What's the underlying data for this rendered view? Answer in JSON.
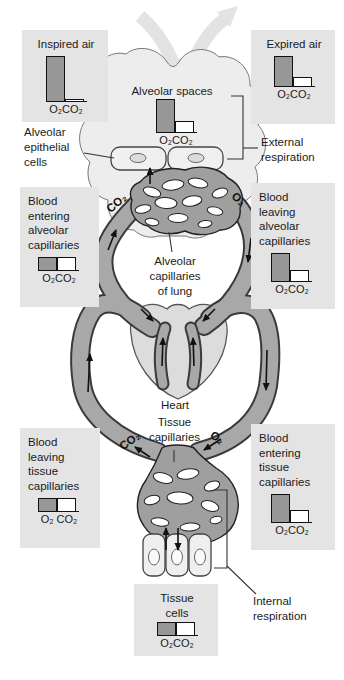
{
  "figure_caption": "Gas exchange diagram: external and internal respiration",
  "colors": {
    "background": "#ffffff",
    "panel_background": "#e4e4e4",
    "bar_o2_fill": "#979797",
    "bar_co2_fill": "#ffffff",
    "vessel_fill": "#a8a8a8",
    "vessel_outline": "#3a3a3a",
    "lung_fill": "#ededed",
    "heart_fill": "#dcdcdc",
    "air_arrow_fill": "#e3e3e3",
    "text": "#1b1b1b"
  },
  "panels": {
    "inspired_air": {
      "label": "Inspired air",
      "o2": 1.0,
      "co2": 0.04,
      "gas": "O₂CO₂"
    },
    "expired_air": {
      "label": "Expired air",
      "o2": 0.67,
      "co2": 0.2,
      "gas": "O₂CO₂"
    },
    "alveolar_spaces": {
      "label": "Alveolar spaces",
      "o2": 0.73,
      "co2": 0.24,
      "gas": "O₂CO₂"
    },
    "blood_entering_alveolar": {
      "label": "Blood\nentering\nalveolar\ncapillaries",
      "o2": 0.29,
      "co2": 0.29,
      "gas": "O₂CO₂"
    },
    "blood_leaving_alveolar": {
      "label": "Blood\nleaving\nalveolar\ncapillaries",
      "o2": 0.62,
      "co2": 0.24,
      "gas": "O₂CO₂"
    },
    "blood_leaving_tissue": {
      "label": "Blood\nleaving\ntissue\ncapillaries",
      "o2": 0.29,
      "co2": 0.29,
      "gas": "O₂ CO₂"
    },
    "blood_entering_tissue": {
      "label": "Blood\nentering\ntissue\ncapillaries",
      "o2": 0.62,
      "co2": 0.27,
      "gas": "O₂CO₂"
    },
    "tissue_cells": {
      "label": "Tissue\ncells",
      "o2": 0.29,
      "co2": 0.29,
      "gas": "O₂CO₂"
    }
  },
  "labels": {
    "alveolar_epithelial_cells": "Alveolar\nepithelial\ncells",
    "external_respiration": "External\nrespiration",
    "alveolar_capillaries_of_lung": "Alveolar\ncapillaries\nof lung",
    "heart": "Heart",
    "tissue_capillaries": "Tissue\ncapillaries",
    "internal_respiration": "Internal\nrespiration",
    "co2": "CO₂",
    "o2": "O₂"
  }
}
